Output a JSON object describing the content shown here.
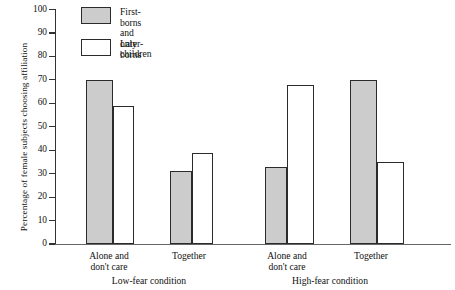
{
  "chart_data": {
    "type": "bar",
    "title": "",
    "xlabel": "",
    "ylabel": "Percentage of female subjects choosing affiliation",
    "ylim": [
      0,
      100
    ],
    "yticks": [
      0,
      10,
      20,
      30,
      40,
      50,
      60,
      70,
      80,
      90,
      100
    ],
    "grid": false,
    "legend_position": "top-left",
    "categories": [
      "Alone and\ndon't care",
      "Together",
      "Alone and\ndon't care",
      "Together"
    ],
    "groups": [
      "Low-fear condition",
      "High-fear condition"
    ],
    "series": [
      {
        "name": "First-borns and\nonly children",
        "color": "#cccccc",
        "values": [
          70,
          31,
          33,
          70
        ]
      },
      {
        "name": "Later-borns",
        "color": "#ffffff",
        "values": [
          59,
          39,
          68,
          35
        ]
      }
    ]
  },
  "axis": {
    "tick_labels": [
      "0",
      "10",
      "20",
      "30",
      "40",
      "50",
      "60",
      "70",
      "80",
      "90",
      "100"
    ]
  },
  "legend": {
    "entries": [
      {
        "label": "First-borns and\nonly children",
        "swatch": "gray"
      },
      {
        "label": "Later-borns",
        "swatch": "white"
      }
    ]
  },
  "xaxis": {
    "categories": [
      "Alone and\ndon't care",
      "Together",
      "Alone and\ndon't care",
      "Together"
    ],
    "groups": [
      "Low-fear condition",
      "High-fear condition"
    ]
  },
  "colors": {
    "bar_fill_first": "#cccccc",
    "bar_fill_later": "#ffffff",
    "bar_stroke": "#2b2b2b",
    "axis": "#333333",
    "text": "#111111",
    "background": "#ffffff"
  }
}
